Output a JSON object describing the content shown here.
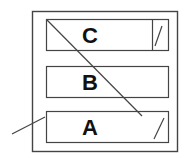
{
  "diagram": {
    "boxes": [
      {
        "id": "C",
        "label": "C",
        "has_divider": true
      },
      {
        "id": "B",
        "label": "B",
        "has_divider": false
      },
      {
        "id": "A",
        "label": "A",
        "has_divider": false
      }
    ],
    "colors": {
      "stroke": "#333333",
      "background": "#ffffff",
      "text": "#111111"
    }
  }
}
